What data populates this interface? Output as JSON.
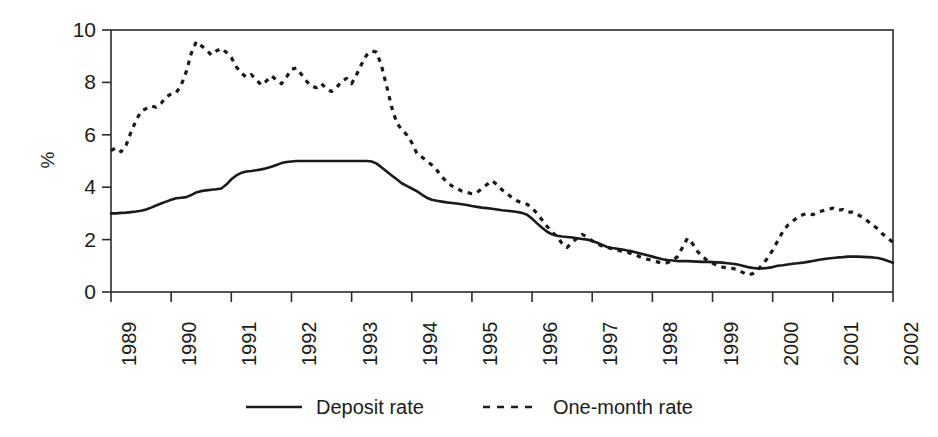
{
  "chart_data": {
    "type": "line",
    "title": "",
    "subtitle": "",
    "xlabel": "",
    "ylabel": "%",
    "ylim": [
      0,
      10
    ],
    "xlim": [
      1989.0,
      2002.0
    ],
    "grid": false,
    "legend_position": "bottom-center",
    "y_ticks": [
      "0",
      "2",
      "4",
      "6",
      "8",
      "10"
    ],
    "y_tick_values": [
      0,
      2,
      4,
      6,
      8,
      10
    ],
    "x_ticks": [
      "1989",
      "1990",
      "1991",
      "1992",
      "1993",
      "1994",
      "1995",
      "1996",
      "1997",
      "1998",
      "1999",
      "2000",
      "2001",
      "2002"
    ],
    "x_tick_values": [
      1989,
      1990,
      1991,
      1992,
      1993,
      1994,
      1995,
      1996,
      1997,
      1998,
      1999,
      2000,
      2001,
      2002
    ],
    "x": [
      1989.0,
      1989.083,
      1989.167,
      1989.25,
      1989.333,
      1989.417,
      1989.5,
      1989.583,
      1989.667,
      1989.75,
      1989.833,
      1989.917,
      1990.0,
      1990.083,
      1990.167,
      1990.25,
      1990.333,
      1990.417,
      1990.5,
      1990.583,
      1990.667,
      1990.75,
      1990.833,
      1990.917,
      1991.0,
      1991.083,
      1991.167,
      1991.25,
      1991.333,
      1991.417,
      1991.5,
      1991.583,
      1991.667,
      1991.75,
      1991.833,
      1991.917,
      1992.0,
      1992.083,
      1992.167,
      1992.25,
      1992.333,
      1992.417,
      1992.5,
      1992.583,
      1992.667,
      1992.75,
      1992.833,
      1992.917,
      1993.0,
      1993.083,
      1993.167,
      1993.25,
      1993.333,
      1993.417,
      1993.5,
      1993.583,
      1993.667,
      1993.75,
      1993.833,
      1993.917,
      1994.0,
      1994.083,
      1994.167,
      1994.25,
      1994.333,
      1994.417,
      1994.5,
      1994.583,
      1994.667,
      1994.75,
      1994.833,
      1994.917,
      1995.0,
      1995.083,
      1995.167,
      1995.25,
      1995.333,
      1995.417,
      1995.5,
      1995.583,
      1995.667,
      1995.75,
      1995.833,
      1995.917,
      1996.0,
      1996.083,
      1996.167,
      1996.25,
      1996.333,
      1996.417,
      1996.5,
      1996.583,
      1996.667,
      1996.75,
      1996.833,
      1996.917,
      1997.0,
      1997.083,
      1997.167,
      1997.25,
      1997.333,
      1997.417,
      1997.5,
      1997.583,
      1997.667,
      1997.75,
      1997.833,
      1997.917,
      1998.0,
      1998.083,
      1998.167,
      1998.25,
      1998.333,
      1998.417,
      1998.5,
      1998.583,
      1998.667,
      1998.75,
      1998.833,
      1998.917,
      1999.0,
      1999.083,
      1999.167,
      1999.25,
      1999.333,
      1999.417,
      1999.5,
      1999.583,
      1999.667,
      1999.75,
      1999.833,
      1999.917,
      2000.0,
      2000.083,
      2000.167,
      2000.25,
      2000.333,
      2000.417,
      2000.5,
      2000.583,
      2000.667,
      2000.75,
      2000.833,
      2000.917,
      2001.0,
      2001.083,
      2001.167,
      2001.25,
      2001.333,
      2001.417,
      2001.5,
      2001.583,
      2001.667,
      2001.75,
      2001.833,
      2001.917,
      2002.0
    ],
    "series": [
      {
        "name": "Deposit rate",
        "style": "solid",
        "color": "#1a1a1a",
        "values": [
          3.0,
          3.0,
          3.02,
          3.03,
          3.05,
          3.07,
          3.1,
          3.15,
          3.22,
          3.3,
          3.38,
          3.45,
          3.52,
          3.58,
          3.6,
          3.62,
          3.7,
          3.8,
          3.85,
          3.88,
          3.9,
          3.92,
          3.95,
          4.1,
          4.3,
          4.45,
          4.55,
          4.6,
          4.62,
          4.65,
          4.68,
          4.72,
          4.78,
          4.85,
          4.92,
          4.96,
          4.98,
          5.0,
          5.0,
          5.0,
          5.0,
          5.0,
          5.0,
          5.0,
          5.0,
          5.0,
          5.0,
          5.0,
          5.0,
          5.0,
          5.0,
          5.0,
          4.98,
          4.9,
          4.75,
          4.6,
          4.45,
          4.3,
          4.15,
          4.05,
          3.95,
          3.85,
          3.72,
          3.6,
          3.52,
          3.48,
          3.45,
          3.42,
          3.4,
          3.38,
          3.35,
          3.32,
          3.28,
          3.25,
          3.22,
          3.2,
          3.18,
          3.15,
          3.12,
          3.1,
          3.08,
          3.05,
          3.02,
          2.95,
          2.8,
          2.62,
          2.45,
          2.3,
          2.2,
          2.15,
          2.12,
          2.1,
          2.08,
          2.05,
          2.02,
          2.0,
          1.95,
          1.88,
          1.8,
          1.72,
          1.68,
          1.65,
          1.62,
          1.58,
          1.55,
          1.5,
          1.45,
          1.4,
          1.35,
          1.3,
          1.25,
          1.22,
          1.2,
          1.18,
          1.18,
          1.18,
          1.17,
          1.16,
          1.15,
          1.15,
          1.14,
          1.13,
          1.12,
          1.1,
          1.08,
          1.05,
          1.0,
          0.95,
          0.92,
          0.9,
          0.9,
          0.92,
          0.95,
          1.0,
          1.02,
          1.05,
          1.08,
          1.1,
          1.12,
          1.15,
          1.18,
          1.22,
          1.25,
          1.28,
          1.3,
          1.32,
          1.33,
          1.35,
          1.35,
          1.35,
          1.34,
          1.33,
          1.32,
          1.3,
          1.25,
          1.18,
          1.12
        ]
      },
      {
        "name": "One-month rate",
        "style": "dashed",
        "color": "#1a1a1a",
        "values": [
          5.4,
          5.5,
          5.35,
          5.6,
          6.1,
          6.55,
          6.9,
          7.0,
          7.1,
          7.05,
          7.2,
          7.45,
          7.55,
          7.6,
          7.9,
          8.4,
          9.1,
          9.55,
          9.4,
          9.25,
          9.05,
          9.2,
          9.3,
          9.15,
          8.95,
          8.6,
          8.35,
          8.2,
          8.3,
          8.1,
          7.9,
          8.05,
          8.25,
          8.1,
          7.95,
          8.2,
          8.5,
          8.55,
          8.3,
          8.05,
          7.85,
          7.8,
          7.95,
          7.75,
          7.65,
          7.8,
          8.05,
          8.15,
          7.95,
          8.3,
          8.7,
          9.05,
          9.2,
          9.15,
          8.6,
          7.85,
          7.05,
          6.45,
          6.2,
          6.0,
          5.7,
          5.3,
          5.15,
          5.0,
          4.85,
          4.65,
          4.4,
          4.2,
          4.05,
          3.95,
          3.85,
          3.8,
          3.75,
          3.8,
          3.95,
          4.1,
          4.25,
          4.1,
          3.9,
          3.75,
          3.6,
          3.48,
          3.4,
          3.35,
          3.2,
          3.0,
          2.75,
          2.5,
          2.3,
          2.1,
          1.85,
          1.7,
          1.9,
          2.05,
          2.2,
          2.1,
          1.95,
          1.85,
          1.75,
          1.7,
          1.65,
          1.6,
          1.55,
          1.52,
          1.45,
          1.38,
          1.3,
          1.25,
          1.2,
          1.15,
          1.1,
          1.12,
          1.2,
          1.35,
          1.7,
          2.05,
          1.85,
          1.55,
          1.35,
          1.2,
          1.1,
          1.0,
          0.95,
          0.92,
          0.9,
          0.85,
          0.75,
          0.65,
          0.7,
          0.85,
          1.05,
          1.3,
          1.6,
          1.95,
          2.3,
          2.55,
          2.7,
          2.85,
          2.95,
          3.0,
          2.95,
          3.05,
          3.1,
          3.15,
          3.2,
          3.12,
          3.15,
          3.05,
          3.05,
          2.95,
          2.85,
          2.7,
          2.55,
          2.4,
          2.2,
          2.05,
          1.9
        ]
      }
    ]
  },
  "legend": {
    "items": [
      {
        "label": "Deposit rate",
        "style": "solid"
      },
      {
        "label": "One-month rate",
        "style": "dashed"
      }
    ]
  },
  "axis": {
    "y_unit": "%"
  }
}
